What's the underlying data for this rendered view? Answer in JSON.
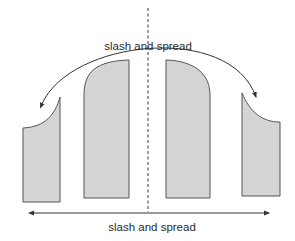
{
  "diagram": {
    "title": "",
    "top_annotation": "slash and spread",
    "bottom_annotation": "slash and spread",
    "colors": {
      "piece_fill": "#d4d4d4",
      "piece_stroke": "#555555",
      "line": "#333333",
      "background": "#ffffff"
    },
    "center_line": {
      "style": "dashed",
      "x": 148
    },
    "pieces": [
      {
        "id": "left-side-piece",
        "shape": "rectangle with concave curved top edge rising to right"
      },
      {
        "id": "center-left-piece",
        "shape": "tall rectangle with rounded top-left corner"
      },
      {
        "id": "center-right-piece",
        "shape": "tall rectangle with rounded top-right corner"
      },
      {
        "id": "right-side-piece",
        "shape": "rectangle with concave curved top edge rising to left"
      }
    ],
    "arrows": [
      {
        "id": "top-arc-arrow",
        "type": "curved double-headed",
        "label_ref": "top_annotation"
      },
      {
        "id": "bottom-straight-arrow",
        "type": "straight double-headed",
        "label_ref": "bottom_annotation"
      }
    ]
  }
}
